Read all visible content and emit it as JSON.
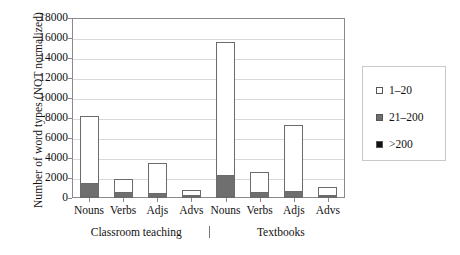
{
  "chart_data": {
    "type": "bar",
    "title": "",
    "subtitle": "",
    "xlabel": "",
    "ylabel": "Number of word types (NOT normalized)",
    "ylim": [
      0,
      18000
    ],
    "y_ticks": [
      0,
      2000,
      4000,
      6000,
      8000,
      10000,
      12000,
      14000,
      16000,
      18000
    ],
    "y_tick_labels": [
      "0",
      "2000",
      "4000",
      "6000",
      "8000",
      "10000",
      "12000",
      "14000",
      "16000",
      "18000"
    ],
    "grid": true,
    "stacked": true,
    "legend_position": "right",
    "categories": [
      "Nouns",
      "Verbs",
      "Adjs",
      "Advs",
      "Nouns",
      "Verbs",
      "Adjs",
      "Advs"
    ],
    "groups": [
      {
        "label": "Classroom teaching",
        "categories": [
          "Nouns",
          "Verbs",
          "Adjs",
          "Advs"
        ]
      },
      {
        "label": "Textbooks",
        "categories": [
          "Nouns",
          "Verbs",
          "Adjs",
          "Advs"
        ]
      }
    ],
    "group_separator": "|",
    "series": [
      {
        "name": ">200",
        "color": "#111111",
        "values": [
          150,
          100,
          50,
          40,
          250,
          150,
          80,
          30
        ]
      },
      {
        "name": "21-200",
        "color": "#6f6f6f",
        "values": [
          1350,
          400,
          350,
          80,
          2100,
          450,
          520,
          70
        ]
      },
      {
        "name": "1-20",
        "color": "#ffffff",
        "values": [
          6700,
          1300,
          3000,
          480,
          13250,
          1950,
          6600,
          750
        ]
      }
    ],
    "totals": [
      8200,
      1800,
      3400,
      600,
      15600,
      2550,
      7200,
      850
    ]
  },
  "legend": {
    "items": [
      {
        "label": "1–20",
        "swatch": "#ffffff"
      },
      {
        "label": "21–200",
        "swatch": "#6f6f6f"
      },
      {
        "label": ">200",
        "swatch": "#111111"
      }
    ]
  },
  "axis": {
    "y_title": "Number of word types (NOT normalized)"
  }
}
